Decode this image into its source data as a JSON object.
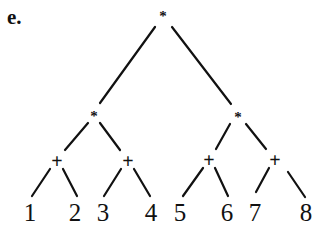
{
  "figure_label": "e.",
  "tree": {
    "nodes": [
      {
        "id": "root",
        "label": "*",
        "x": 163,
        "y": 16,
        "kind": "star"
      },
      {
        "id": "l1",
        "label": "*",
        "x": 94,
        "y": 116,
        "kind": "star"
      },
      {
        "id": "r1",
        "label": "*",
        "x": 238,
        "y": 117,
        "kind": "star"
      },
      {
        "id": "p1",
        "label": "+",
        "x": 57,
        "y": 161,
        "kind": "plus"
      },
      {
        "id": "p2",
        "label": "+",
        "x": 128,
        "y": 161,
        "kind": "plus"
      },
      {
        "id": "p3",
        "label": "+",
        "x": 209,
        "y": 160,
        "kind": "plus"
      },
      {
        "id": "p4",
        "label": "+",
        "x": 275,
        "y": 160,
        "kind": "plus"
      },
      {
        "id": "n1",
        "label": "1",
        "x": 30,
        "y": 212,
        "kind": "leaf"
      },
      {
        "id": "n2",
        "label": "2",
        "x": 75,
        "y": 212,
        "kind": "leaf"
      },
      {
        "id": "n3",
        "label": "3",
        "x": 103,
        "y": 212,
        "kind": "leaf"
      },
      {
        "id": "n4",
        "label": "4",
        "x": 151,
        "y": 212,
        "kind": "leaf"
      },
      {
        "id": "n5",
        "label": "5",
        "x": 180,
        "y": 212,
        "kind": "leaf"
      },
      {
        "id": "n6",
        "label": "6",
        "x": 227,
        "y": 212,
        "kind": "leaf"
      },
      {
        "id": "n7",
        "label": "7",
        "x": 255,
        "y": 212,
        "kind": "leaf"
      },
      {
        "id": "n8",
        "label": "8",
        "x": 306,
        "y": 212,
        "kind": "leaf"
      }
    ],
    "edges": [
      {
        "x1": 155,
        "y1": 27,
        "x2": 100,
        "y2": 103
      },
      {
        "x1": 172,
        "y1": 27,
        "x2": 231,
        "y2": 104
      },
      {
        "x1": 88,
        "y1": 123,
        "x2": 65,
        "y2": 150
      },
      {
        "x1": 100,
        "y1": 123,
        "x2": 120,
        "y2": 150
      },
      {
        "x1": 230,
        "y1": 124,
        "x2": 216,
        "y2": 149
      },
      {
        "x1": 246,
        "y1": 124,
        "x2": 266,
        "y2": 149
      },
      {
        "x1": 50,
        "y1": 169,
        "x2": 32,
        "y2": 196
      },
      {
        "x1": 63,
        "y1": 169,
        "x2": 77,
        "y2": 196
      },
      {
        "x1": 121,
        "y1": 169,
        "x2": 104,
        "y2": 196
      },
      {
        "x1": 134,
        "y1": 169,
        "x2": 150,
        "y2": 196
      },
      {
        "x1": 203,
        "y1": 168,
        "x2": 183,
        "y2": 196
      },
      {
        "x1": 215,
        "y1": 168,
        "x2": 228,
        "y2": 196
      },
      {
        "x1": 269,
        "y1": 168,
        "x2": 256,
        "y2": 192
      },
      {
        "x1": 288,
        "y1": 172,
        "x2": 305,
        "y2": 197
      }
    ]
  }
}
